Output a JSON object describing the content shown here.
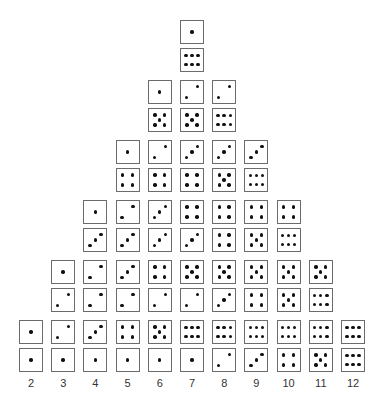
{
  "chart_data": {
    "type": "diagram",
    "x_labels": [
      "2",
      "3",
      "4",
      "5",
      "6",
      "7",
      "8",
      "9",
      "10",
      "11",
      "12"
    ],
    "counts": [
      1,
      2,
      3,
      4,
      5,
      6,
      5,
      4,
      3,
      2,
      1
    ],
    "columns": [
      {
        "sum": "2",
        "pairs": [
          [
            1,
            1
          ]
        ]
      },
      {
        "sum": "3",
        "pairs": [
          [
            2,
            1
          ],
          [
            1,
            2
          ]
        ]
      },
      {
        "sum": "4",
        "pairs": [
          [
            3,
            1
          ],
          [
            2,
            2
          ],
          [
            1,
            3
          ]
        ]
      },
      {
        "sum": "5",
        "pairs": [
          [
            4,
            1
          ],
          [
            3,
            2
          ],
          [
            2,
            3
          ],
          [
            1,
            4
          ]
        ]
      },
      {
        "sum": "6",
        "pairs": [
          [
            5,
            1
          ],
          [
            4,
            2
          ],
          [
            3,
            3
          ],
          [
            2,
            4
          ],
          [
            1,
            5
          ]
        ]
      },
      {
        "sum": "7",
        "pairs": [
          [
            6,
            1
          ],
          [
            5,
            2
          ],
          [
            4,
            3
          ],
          [
            3,
            4
          ],
          [
            2,
            5
          ],
          [
            1,
            6
          ]
        ]
      },
      {
        "sum": "8",
        "pairs": [
          [
            6,
            2
          ],
          [
            5,
            3
          ],
          [
            4,
            4
          ],
          [
            3,
            5
          ],
          [
            2,
            6
          ]
        ]
      },
      {
        "sum": "9",
        "pairs": [
          [
            6,
            3
          ],
          [
            5,
            4
          ],
          [
            4,
            5
          ],
          [
            3,
            6
          ]
        ]
      },
      {
        "sum": "10",
        "pairs": [
          [
            6,
            4
          ],
          [
            5,
            5
          ],
          [
            4,
            6
          ]
        ]
      },
      {
        "sum": "11",
        "pairs": [
          [
            6,
            5
          ],
          [
            5,
            6
          ]
        ]
      },
      {
        "sum": "12",
        "pairs": [
          [
            6,
            6
          ]
        ]
      }
    ]
  }
}
